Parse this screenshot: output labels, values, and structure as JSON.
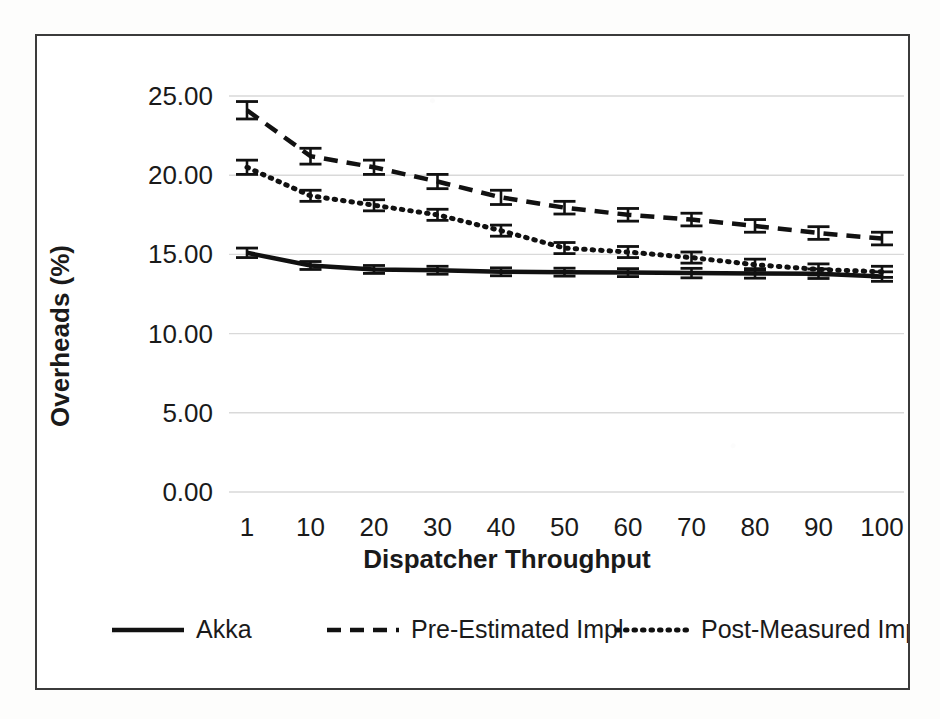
{
  "chart_data": {
    "type": "line",
    "title": "",
    "xlabel": "Dispatcher Throughput",
    "ylabel": "Overheads (%)",
    "categories": [
      "1",
      "10",
      "20",
      "30",
      "40",
      "50",
      "60",
      "70",
      "80",
      "90",
      "100"
    ],
    "x_tick_labels": [
      "1",
      "10",
      "20",
      "30",
      "40",
      "50",
      "60",
      "70",
      "80",
      "90",
      "100"
    ],
    "y_tick_labels": [
      "0.00",
      "5.00",
      "10.00",
      "15.00",
      "20.00",
      "25.00"
    ],
    "y_ticks": [
      0,
      5,
      10,
      15,
      20,
      25
    ],
    "ylim": [
      0,
      25
    ],
    "grid": "horizontal",
    "legend_position": "bottom",
    "error_bars": true,
    "series": [
      {
        "name": "Akka",
        "style": "solid",
        "color": "#111111",
        "values": [
          15.1,
          14.3,
          14.05,
          14.0,
          13.9,
          13.88,
          13.85,
          13.82,
          13.8,
          13.78,
          13.6
        ],
        "errors": [
          0.3,
          0.25,
          0.25,
          0.25,
          0.25,
          0.25,
          0.25,
          0.3,
          0.3,
          0.3,
          0.3
        ]
      },
      {
        "name": "Pre-Estimated Impl",
        "style": "dashed",
        "color": "#111111",
        "values": [
          24.1,
          21.2,
          20.5,
          19.6,
          18.6,
          17.95,
          17.5,
          17.2,
          16.8,
          16.35,
          16.0
        ],
        "errors": [
          0.55,
          0.5,
          0.45,
          0.45,
          0.45,
          0.4,
          0.4,
          0.4,
          0.4,
          0.4,
          0.4
        ]
      },
      {
        "name": "Post-Measured Impl",
        "style": "dotted",
        "color": "#111111",
        "values": [
          20.5,
          18.7,
          18.1,
          17.5,
          16.5,
          15.4,
          15.15,
          14.8,
          14.35,
          14.05,
          13.9
        ],
        "errors": [
          0.45,
          0.35,
          0.35,
          0.35,
          0.35,
          0.35,
          0.35,
          0.35,
          0.35,
          0.35,
          0.35
        ]
      }
    ]
  },
  "legend": {
    "items": [
      {
        "label": "Akka",
        "style": "solid"
      },
      {
        "label": "Pre-Estimated Impl",
        "style": "dashed"
      },
      {
        "label": "Post-Measured Impl",
        "style": "dotted"
      }
    ]
  },
  "colors": {
    "ink": "#111111",
    "frame": "#3b3b3b",
    "gridline": "#d9d9d9",
    "background": "#ffffff"
  }
}
